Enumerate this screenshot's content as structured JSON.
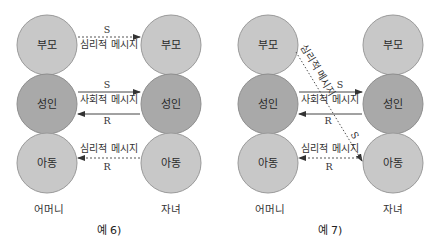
{
  "colors": {
    "parent_child_fill": "#c8c8c8",
    "adult_fill": "#a9a9a9",
    "circle_stroke": "#9a9a9a",
    "line": "#444444",
    "background": "#ffffff"
  },
  "diagrams": [
    {
      "caption": "예 6)",
      "left_person": "어머니",
      "right_person": "자녀",
      "left_states": [
        "부모",
        "성인",
        "아동"
      ],
      "right_states": [
        "부모",
        "성인",
        "아동"
      ],
      "transactions": [
        {
          "from": "left.부모",
          "to": "right.부모",
          "style": "dashed",
          "label_above": "S",
          "label_below": "심리적 메시지"
        },
        {
          "from": "left.성인",
          "to": "right.성인",
          "style": "solid",
          "label_above": "S",
          "label_below": "사회적 메시지"
        },
        {
          "from": "right.성인",
          "to": "left.성인",
          "style": "solid",
          "label_below": "R"
        },
        {
          "from": "right.아동",
          "to": "left.아동",
          "style": "dashed",
          "label_above": "심리적 메시지",
          "label_below": "R"
        }
      ],
      "labels": {
        "top_s": "S",
        "top_msg": "심리적 메시지",
        "mid_s": "S",
        "mid_msg": "사회적 메시지",
        "mid_r": "R",
        "bot_msg": "심리적 메시지",
        "bot_r": "R"
      }
    },
    {
      "caption": "예 7)",
      "left_person": "어머니",
      "right_person": "자녀",
      "left_states": [
        "부모",
        "성인",
        "아동"
      ],
      "right_states": [
        "부모",
        "성인",
        "아동"
      ],
      "transactions": [
        {
          "from": "left.부모",
          "to": "right.아동",
          "style": "dotted-diagonal",
          "label_along": "심리적 메시지",
          "label_end": "S"
        },
        {
          "from": "left.성인",
          "to": "right.성인",
          "style": "solid",
          "label_above": "S",
          "label_below": "사회적 메시지"
        },
        {
          "from": "right.성인",
          "to": "left.성인",
          "style": "solid",
          "label_below": "R"
        },
        {
          "from": "right.아동",
          "to": "left.아동",
          "style": "dashed",
          "label_above": "심리적 메시지",
          "label_below": "R"
        }
      ],
      "labels": {
        "diag_msg": "심리적 메시지",
        "diag_s": "S",
        "mid_s": "S",
        "mid_msg": "사회적 메시지",
        "mid_r": "R",
        "bot_msg": "심리적 메시지",
        "bot_r": "R"
      }
    }
  ]
}
